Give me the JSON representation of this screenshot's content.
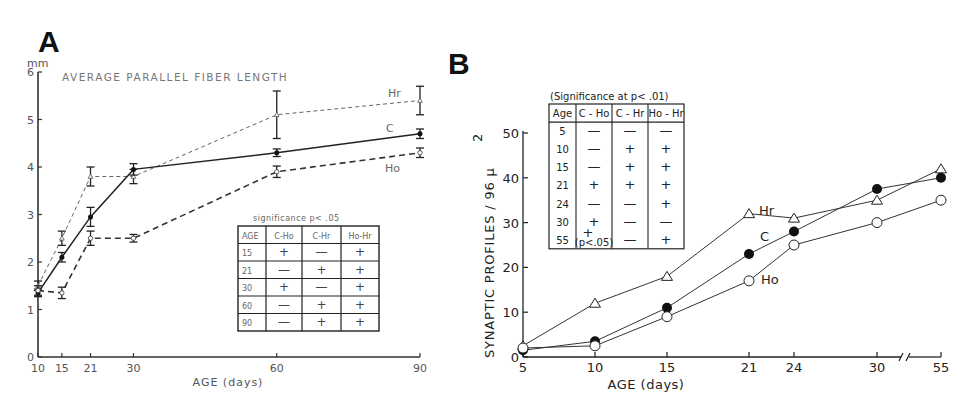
{
  "chart_data": [
    {
      "panel": "A",
      "type": "line",
      "title": "AVERAGE PARALLEL FIBER LENGTH",
      "xlabel": "AGE (days)",
      "ylabel": "mm",
      "x": [
        10,
        15,
        21,
        30,
        60,
        90
      ],
      "xticks": [
        "10",
        "15",
        "21",
        "30",
        "60",
        "90"
      ],
      "yticks": [
        "0",
        "1",
        "2",
        "3",
        "4",
        "5",
        "6"
      ],
      "ylim": [
        0,
        6
      ],
      "xlim": [
        10,
        90
      ],
      "grid": false,
      "series": [
        {
          "name": "Hr",
          "style": "dashed-light",
          "marker": "open-triangle",
          "values": [
            1.5,
            2.5,
            3.8,
            3.8,
            5.1,
            5.4
          ],
          "err": [
            0.1,
            0.15,
            0.2,
            0.15,
            0.5,
            0.3
          ]
        },
        {
          "name": "C",
          "style": "solid",
          "marker": "filled-circle",
          "values": [
            1.35,
            2.1,
            2.95,
            3.95,
            4.3,
            4.7
          ],
          "err": [
            0.08,
            0.1,
            0.2,
            0.12,
            0.08,
            0.1
          ]
        },
        {
          "name": "Ho",
          "style": "dashed-heavy",
          "marker": "open-circle",
          "values": [
            1.4,
            1.35,
            2.5,
            2.5,
            3.9,
            4.3
          ],
          "err": [
            0.1,
            0.12,
            0.15,
            0.08,
            0.12,
            0.1
          ]
        }
      ],
      "significance_table": {
        "caption": "significance p<.05",
        "headers": [
          "AGE",
          "C-Ho",
          "C-Hr",
          "Ho-Hr"
        ],
        "rows": [
          [
            "15",
            "+",
            "—",
            "+"
          ],
          [
            "21",
            "—",
            "+",
            "+"
          ],
          [
            "30",
            "+",
            "—",
            "+"
          ],
          [
            "60",
            "—",
            "+",
            "+"
          ],
          [
            "90",
            "—",
            "+",
            "+"
          ]
        ]
      }
    },
    {
      "panel": "B",
      "type": "line",
      "title": "",
      "xlabel": "AGE (days)",
      "ylabel": "SYNAPTIC PROFILES/96 μ²",
      "x": [
        5,
        10,
        15,
        21,
        24,
        30,
        55
      ],
      "xticks": [
        "5",
        "10",
        "15",
        "21",
        "24",
        "30",
        "55"
      ],
      "yticks": [
        "0",
        "10",
        "20",
        "30",
        "40",
        "50"
      ],
      "ylim": [
        0,
        50
      ],
      "axis_break": "between 30 and 55",
      "grid": false,
      "series": [
        {
          "name": "Hr",
          "marker": "open-triangle",
          "values": [
            2.5,
            12,
            18,
            32,
            31,
            35,
            42
          ]
        },
        {
          "name": "C",
          "marker": "filled-circle",
          "values": [
            1.5,
            3.5,
            11,
            23,
            28,
            37.5,
            40
          ]
        },
        {
          "name": "Ho",
          "marker": "open-circle",
          "values": [
            2,
            2.5,
            9,
            17,
            25,
            30,
            35
          ]
        }
      ],
      "significance_table": {
        "caption": "(Significance at p<.01)",
        "headers": [
          "Age",
          "C - Ho",
          "C - Hr",
          "Ho - Hr"
        ],
        "rows": [
          [
            "5",
            "—",
            "—",
            "—"
          ],
          [
            "10",
            "—",
            "+",
            "+"
          ],
          [
            "15",
            "—",
            "+",
            "+"
          ],
          [
            "21",
            "+",
            "+",
            "+"
          ],
          [
            "24",
            "—",
            "—",
            "+"
          ],
          [
            "30",
            "+",
            "—",
            "—"
          ],
          [
            "55",
            "+ (p<.05)",
            "—",
            "+"
          ]
        ]
      }
    }
  ],
  "labels": {
    "panel_a": "A",
    "panel_b": "B",
    "a_unit": "mm",
    "a_title": "AVERAGE PARALLEL FIBER LENGTH",
    "a_xlabel": "AGE (days)",
    "a_series_hr": "Hr",
    "a_series_c": "C",
    "a_series_ho": "Ho",
    "a_table_caption": "significance  p< .05",
    "b_ylabel": "SYNAPTIC PROFILES / 96 μ",
    "b_ylabel_sup": "2",
    "b_xlabel": "AGE (days)",
    "b_series_hr": "Hr",
    "b_series_c": "C",
    "b_series_ho": "Ho",
    "b_table_caption": "(Significance at p< .01)",
    "b_p05_note": "(p<.05)"
  }
}
